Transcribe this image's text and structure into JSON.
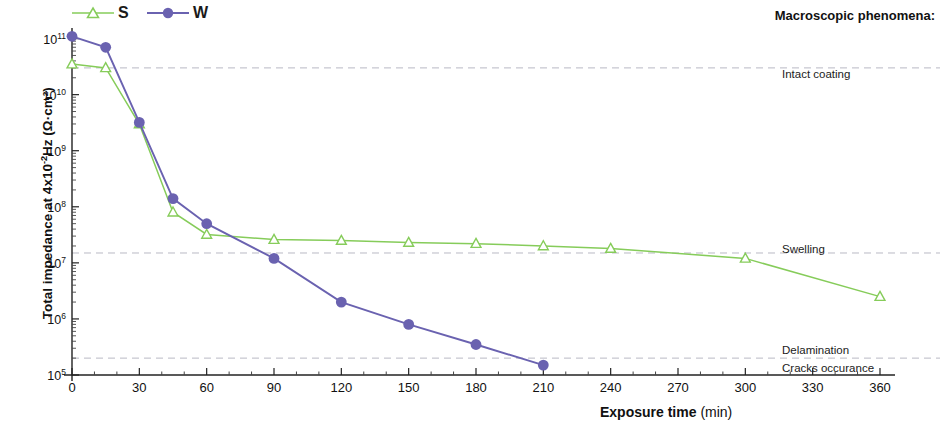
{
  "chart_data": {
    "type": "line",
    "title": "",
    "xlabel": "Exposure time",
    "xlabel_unit": "(min)",
    "ylabel_main": "Total impedance at 4x10",
    "ylabel_exp": "-2",
    "ylabel_tail": "Hz",
    "ylabel_unit": "(Ω·cm²)",
    "xlim": [
      0,
      360
    ],
    "ylim": [
      100000,
      200000000000
    ],
    "yscale": "log",
    "xticks": [
      0,
      30,
      60,
      90,
      120,
      150,
      180,
      210,
      240,
      270,
      300,
      330,
      360
    ],
    "xtick_labels": [
      "0",
      "30",
      "60",
      "90",
      "120",
      "150",
      "180",
      "210",
      "240",
      "270",
      "300",
      "330",
      "360"
    ],
    "yticks": [
      100000,
      1000000,
      10000000,
      100000000,
      1000000000,
      10000000000,
      100000000000
    ],
    "ytick_labels": [
      "10⁵",
      "10⁶",
      "10⁷",
      "10⁸",
      "10⁹",
      "10¹⁰",
      "10¹¹"
    ],
    "ytick_mantissas": [
      "5",
      "6",
      "7",
      "8",
      "9",
      "10",
      "11"
    ],
    "grid": false,
    "legend_position": "top-left",
    "series": [
      {
        "name": "S",
        "color": "#86cc5a",
        "marker": "open-triangle",
        "x": [
          0,
          15,
          30,
          45,
          60,
          90,
          120,
          150,
          180,
          210,
          240,
          300,
          360
        ],
        "y": [
          35000000000.0,
          30000000000.0,
          3000000000.0,
          80000000.0,
          32000000.0,
          26000000.0,
          25000000.0,
          23000000.0,
          22000000.0,
          20000000.0,
          18000000.0,
          12000000.0,
          2500000.0
        ]
      },
      {
        "name": "W",
        "color": "#6a62b0",
        "marker": "filled-circle",
        "x": [
          0,
          15,
          30,
          45,
          60,
          90,
          120,
          150,
          180,
          210
        ],
        "y": [
          110000000000.0,
          70000000000.0,
          3200000000.0,
          140000000.0,
          50000000.0,
          12000000.0,
          2000000.0,
          800000.0,
          350000.0,
          150000.0
        ]
      }
    ],
    "reference_lines": [
      {
        "y": 30000000000.0,
        "label": "Intact coating"
      },
      {
        "y": 15000000.0,
        "label": "Swelling"
      },
      {
        "y": 200000.0,
        "label": "Delamination"
      }
    ],
    "annotations": {
      "header": "Macroscopic phenomena:",
      "items": [
        {
          "label": "Intact coating",
          "y_px": 68
        },
        {
          "label": "Swelling",
          "y_px": 243
        },
        {
          "label": "Delamination",
          "y_px": 344
        },
        {
          "label": "Cracks occurance",
          "y_px": 362
        }
      ]
    }
  }
}
